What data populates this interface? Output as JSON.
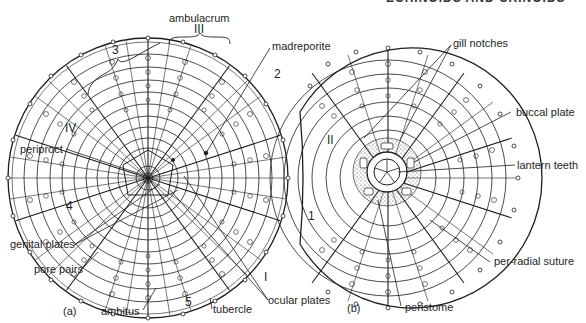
{
  "figure": {
    "type": "scientific-illustration",
    "header_fragment": "ECHINOIDS AND CRINOIDS",
    "panels": [
      {
        "id": "a",
        "caption": "(a)",
        "labels": {
          "ambulacrum": "ambulacrum",
          "ambulacrum_numeral": "III",
          "interamb_3": "3",
          "madreporite": "madreporite",
          "interamb_2": "2",
          "amb_IV": "IV",
          "periproct": "periproct",
          "interamb_4": "4",
          "genital_plates": "genital plates",
          "pore_pairs": "pore pairs",
          "ambitus": "ambitus",
          "interamb_5": "5",
          "tubercle": "tubercle",
          "amb_I": "I",
          "ocular_plates": "ocular plates"
        }
      },
      {
        "id": "b",
        "caption": "(b)",
        "labels": {
          "gill_notches": "gill notches",
          "amb_II": "II",
          "buccal_plate": "buccal plate",
          "lantern_teeth": "lantern teeth",
          "interamb_1": "1",
          "per_radial_suture": "per-radial suture",
          "peristome": "peristome"
        }
      }
    ]
  },
  "colors": {
    "ink": "#1e1e1e",
    "paper": "#ffffff",
    "stipple": "#555555"
  }
}
